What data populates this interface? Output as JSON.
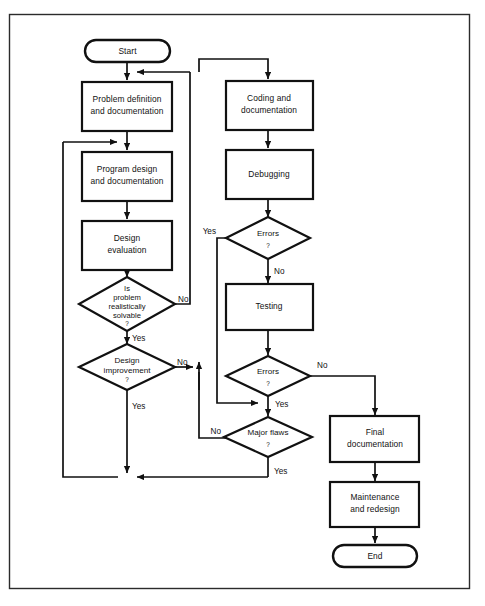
{
  "diagram": {
    "kind": "flowchart",
    "colors": {
      "stroke": "#111111",
      "fill": "#ffffff",
      "frame": "#2b2b2b"
    },
    "terminators": {
      "start": "Start",
      "end": "End"
    },
    "processes": {
      "problem_definition_l1": "Problem definition",
      "problem_definition_l2": "and documentation",
      "program_design_l1": "Program design",
      "program_design_l2": "and documentation",
      "design_evaluation_l1": "Design",
      "design_evaluation_l2": "evaluation",
      "coding_l1": "Coding and",
      "coding_l2": "documentation",
      "debugging": "Debugging",
      "testing": "Testing",
      "final_doc_l1": "Final",
      "final_doc_l2": "documentation",
      "maintenance_l1": "Maintenance",
      "maintenance_l2": "and redesign"
    },
    "decisions": {
      "solvable_l1": "Is",
      "solvable_l2": "problem",
      "solvable_l3": "realistically",
      "solvable_l4": "solvable",
      "solvable_q": "?",
      "design_improvement_l1": "Design",
      "design_improvement_l2": "improvement",
      "design_improvement_q": "?",
      "errors_debug_l1": "Errors",
      "errors_debug_q": "?",
      "errors_test_l1": "Errors",
      "errors_test_q": "?",
      "major_flaws_l1": "Major flaws",
      "major_flaws_q": "?"
    },
    "edge_labels": {
      "solvable_no": "No",
      "solvable_yes": "Yes",
      "improvement_no": "No",
      "improvement_yes": "Yes",
      "errors_debug_yes": "Yes",
      "errors_debug_no": "No",
      "errors_test_no": "No",
      "errors_test_yes": "Yes",
      "major_flaws_no": "No",
      "major_flaws_yes": "Yes"
    }
  }
}
